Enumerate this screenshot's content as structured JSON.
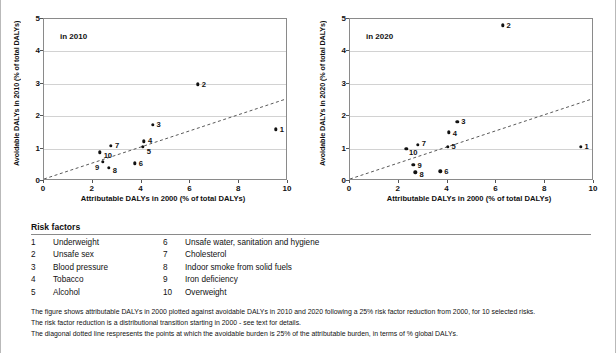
{
  "chart_data": [
    {
      "type": "scatter",
      "panel_label": "in 2010",
      "title": "",
      "xlabel": "Attributable DALYs in 2000  (% of total DALYs)",
      "ylabel": "Avoidable DALYs in 2010 (% of total DALYs)",
      "xlim": [
        0,
        10
      ],
      "ylim": [
        0,
        5
      ],
      "xticks": [
        0,
        2,
        4,
        6,
        8,
        10
      ],
      "yticks": [
        0,
        1,
        2,
        3,
        4,
        5
      ],
      "grid": true,
      "legend_position": "below-figure",
      "reference_line": {
        "label": "diagonal dotted line",
        "style": "dotted",
        "slope": 0.25,
        "intercept": 0,
        "from": [
          0,
          0
        ],
        "to": [
          10,
          2.5
        ]
      },
      "points": [
        {
          "label": "1",
          "name": "Underweight",
          "x": 9.5,
          "y": 1.6,
          "label_dx": 4,
          "label_dy": 0
        },
        {
          "label": "2",
          "name": "Unsafe sex",
          "x": 6.3,
          "y": 2.98,
          "label_dx": 4,
          "label_dy": 0
        },
        {
          "label": "3",
          "name": "Blood pressure",
          "x": 4.45,
          "y": 1.73,
          "label_dx": 4,
          "label_dy": -1
        },
        {
          "label": "4",
          "name": "Tobacco",
          "x": 4.1,
          "y": 1.22,
          "label_dx": 4,
          "label_dy": -1
        },
        {
          "label": "5",
          "name": "Alcohol",
          "x": 4.05,
          "y": 1.05,
          "label_dx": 4,
          "label_dy": 4
        },
        {
          "label": "6",
          "name": "Unsafe water, sanitation and hygiene",
          "x": 3.72,
          "y": 0.55,
          "label_dx": 4,
          "label_dy": 0
        },
        {
          "label": "7",
          "name": "Cholesterol",
          "x": 2.75,
          "y": 1.08,
          "label_dx": 4,
          "label_dy": -1
        },
        {
          "label": "8",
          "name": "Indoor smoke from solid fuels",
          "x": 2.65,
          "y": 0.4,
          "label_dx": 4,
          "label_dy": 2
        },
        {
          "label": "9",
          "name": "Iron deficiency",
          "x": 2.42,
          "y": 0.6,
          "label_dx": -8,
          "label_dy": 5
        },
        {
          "label": "10",
          "name": "Overweight",
          "x": 2.28,
          "y": 0.88,
          "label_dx": 4,
          "label_dy": 3
        }
      ]
    },
    {
      "type": "scatter",
      "panel_label": "in 2020",
      "title": "",
      "xlabel": "Attributable DALYs in 2000 (% of total DALYs)",
      "ylabel": "Avoidable DALYs in 2020 (% of total DALYs)",
      "xlim": [
        0,
        10
      ],
      "ylim": [
        0,
        5
      ],
      "xticks": [
        0,
        2,
        4,
        6,
        8,
        10
      ],
      "yticks": [
        0,
        1,
        2,
        3,
        4,
        5
      ],
      "grid": true,
      "legend_position": "below-figure",
      "reference_line": {
        "label": "diagonal dotted line",
        "style": "dotted",
        "slope": 0.25,
        "intercept": 0,
        "from": [
          0,
          0
        ],
        "to": [
          10,
          2.5
        ]
      },
      "points": [
        {
          "label": "1",
          "name": "Underweight",
          "x": 9.45,
          "y": 1.05,
          "label_dx": 4,
          "label_dy": -1
        },
        {
          "label": "2",
          "name": "Unsafe sex",
          "x": 6.25,
          "y": 4.8,
          "label_dx": 4,
          "label_dy": 0
        },
        {
          "label": "3",
          "name": "Blood pressure",
          "x": 4.4,
          "y": 1.82,
          "label_dx": 4,
          "label_dy": -1
        },
        {
          "label": "4",
          "name": "Tobacco",
          "x": 4.05,
          "y": 1.5,
          "label_dx": 4,
          "label_dy": 1
        },
        {
          "label": "5",
          "name": "Alcohol",
          "x": 4.0,
          "y": 1.05,
          "label_dx": 4,
          "label_dy": -1
        },
        {
          "label": "6",
          "name": "Unsafe water, sanitation and hygiene",
          "x": 3.7,
          "y": 0.3,
          "label_dx": 4,
          "label_dy": 0
        },
        {
          "label": "7",
          "name": "Cholesterol",
          "x": 2.78,
          "y": 1.12,
          "label_dx": 4,
          "label_dy": -2
        },
        {
          "label": "8",
          "name": "Indoor smoke from solid fuels",
          "x": 2.68,
          "y": 0.27,
          "label_dx": 4,
          "label_dy": 2
        },
        {
          "label": "9",
          "name": "Iron deficiency",
          "x": 2.6,
          "y": 0.5,
          "label_dx": 4,
          "label_dy": 0
        },
        {
          "label": "10",
          "name": "Overweight",
          "x": 2.3,
          "y": 1.0,
          "label_dx": 3,
          "label_dy": 3
        }
      ]
    }
  ],
  "legend": {
    "title": "Risk factors",
    "column_one": [
      {
        "num": "1",
        "name": "Underweight"
      },
      {
        "num": "2",
        "name": "Unsafe sex"
      },
      {
        "num": "3",
        "name": "Blood pressure"
      },
      {
        "num": "4",
        "name": "Tobacco"
      },
      {
        "num": "5",
        "name": "Alcohol"
      }
    ],
    "column_two": [
      {
        "num": "6",
        "name": "Unsafe water, sanitation and hygiene"
      },
      {
        "num": "7",
        "name": "Cholesterol"
      },
      {
        "num": "8",
        "name": "Indoor smoke from solid fuels"
      },
      {
        "num": "9",
        "name": "Iron deficiency"
      },
      {
        "num": "10",
        "name": "Overweight"
      }
    ]
  },
  "footnotes": [
    "The figure shows attributable DALYs in 2000 plotted against avoidable DALYs in 2010 and 2020 following a 25% risk factor reduction from 2000, for 10 selected risks.",
    "The risk factor reduction is a distributional transition starting in 2000 - see text for details.",
    "The diagonal dotted line respresents the points at which the avoidable burden is 25% of the attributable burden, in terms of % global DALYs."
  ],
  "colors": {
    "point": "#111111",
    "gridline": "#d2d2d2",
    "frame": "#8a8a8a",
    "text": "#111111"
  }
}
